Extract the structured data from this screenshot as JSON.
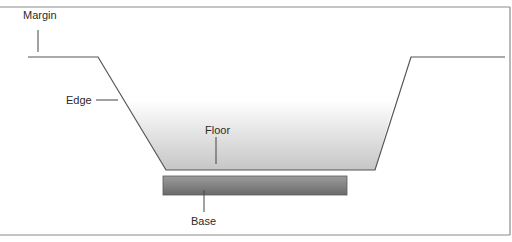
{
  "diagram": {
    "type": "cross-section",
    "labels": {
      "margin": "Margin",
      "edge": "Edge",
      "floor": "Floor",
      "base": "Base"
    },
    "colors": {
      "frame": "#7a7a7a",
      "outline": "#555555",
      "fill_top": "#ffffff",
      "fill_bottom": "#c9c9c9",
      "base_light": "#9a9a9a",
      "base_dark": "#6b6b6b"
    }
  }
}
